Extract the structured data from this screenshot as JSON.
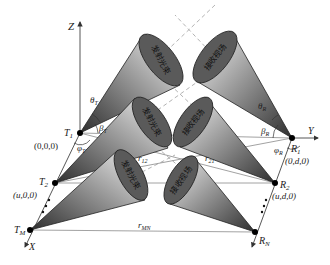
{
  "axes": {
    "z": "Z",
    "y": "Y",
    "x": "X"
  },
  "transmitters": [
    {
      "label": "T",
      "sub": "1",
      "coord": "(0,0,0)"
    },
    {
      "label": "T",
      "sub": "2",
      "coord": "(u,0,0)"
    },
    {
      "label": "T",
      "sub": "M"
    }
  ],
  "receivers": [
    {
      "label": "R",
      "sub": "1",
      "coord": "(0,d,0)"
    },
    {
      "label": "R",
      "sub": "2",
      "coord": "(u,d,0)"
    },
    {
      "label": "R",
      "sub": "N"
    }
  ],
  "angles": {
    "theta_t": {
      "sym": "θ",
      "sub": "T"
    },
    "beta_t": {
      "sym": "β",
      "sub": "T"
    },
    "phi_t": {
      "sym": "φ",
      "sub": "T"
    },
    "theta_r": {
      "sym": "θ",
      "sub": "R"
    },
    "beta_r": {
      "sym": "β",
      "sub": "R"
    },
    "phi_r": {
      "sym": "φ",
      "sub": "R"
    }
  },
  "distances": {
    "r12": {
      "sym": "r",
      "sub": "12"
    },
    "r21": {
      "sym": "r",
      "sub": "21"
    },
    "rMN": {
      "sym": "r",
      "sub": "MN"
    }
  },
  "cone_labels": {
    "transmit": "发射光束",
    "receive": "接收视场"
  },
  "ellipsis": "⋮",
  "colors": {
    "cone_dark": "#3a3a3a",
    "cone_light": "#f2f2f2",
    "ellipse_fill": "#5a5a5a",
    "line": "#555555",
    "dash": "#9a9a9a"
  }
}
